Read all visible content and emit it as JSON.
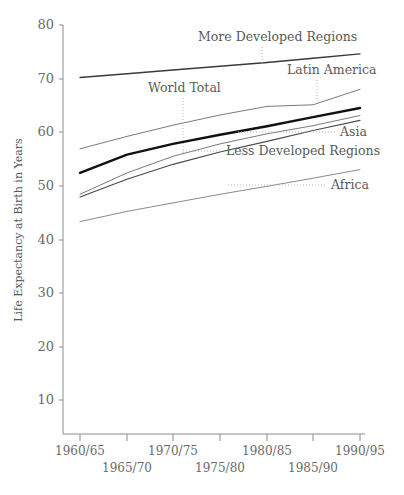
{
  "chart_data": {
    "type": "line",
    "title": "",
    "xlabel": "",
    "ylabel": "Life Expectancy at Birth in Years",
    "ylim": [
      0,
      80
    ],
    "xlim": [
      0,
      7
    ],
    "grid": false,
    "legend_position": "inline-labels-with-leader-lines",
    "categories": [
      "1960/65",
      "1965/70",
      "1970/75",
      "1975/80",
      "1980/85",
      "1985/90",
      "1990/95"
    ],
    "ytick_labels": [
      "10",
      "20",
      "30",
      "40",
      "50",
      "60",
      "70",
      "80"
    ],
    "ytick_values": [
      10,
      20,
      30,
      40,
      50,
      60,
      70,
      80
    ],
    "series": [
      {
        "name": "More Developed Regions",
        "style": "solid-medium",
        "color": "#3a3a3a",
        "width": 1.4,
        "values": [
          70.2,
          70.9,
          71.6,
          72.3,
          73.0,
          73.8,
          74.6
        ]
      },
      {
        "name": "Latin America",
        "style": "solid-thin",
        "color": "#7a7a7a",
        "width": 1.0,
        "values": [
          56.9,
          59.2,
          61.3,
          63.2,
          64.8,
          65.1,
          68.0
        ]
      },
      {
        "name": "World Total",
        "style": "solid-bold",
        "color": "#111111",
        "width": 2.4,
        "values": [
          52.4,
          55.8,
          57.8,
          59.5,
          61.1,
          62.8,
          64.5
        ]
      },
      {
        "name": "Asia",
        "style": "solid-thin",
        "color": "#7a7a7a",
        "width": 1.0,
        "values": [
          48.4,
          52.4,
          55.5,
          57.8,
          59.7,
          61.2,
          63.1
        ]
      },
      {
        "name": "Less Developed Regions",
        "style": "solid-medium",
        "color": "#4a4a4a",
        "width": 1.2,
        "values": [
          47.9,
          51.2,
          54.0,
          56.3,
          58.3,
          60.3,
          62.2
        ]
      },
      {
        "name": "Africa",
        "style": "solid-thin",
        "color": "#8a8a8a",
        "width": 1.0,
        "values": [
          43.3,
          45.2,
          46.8,
          48.4,
          49.9,
          51.4,
          53.0
        ]
      }
    ],
    "annotations": [
      {
        "text": "More Developed Regions",
        "anchor": "start",
        "x_px": 198,
        "y_px": 41,
        "leader": {
          "x1": 262,
          "y1": 47,
          "x2": 262,
          "y2": 65
        }
      },
      {
        "text": "Latin America",
        "anchor": "start",
        "x_px": 287,
        "y_px": 74,
        "leader": {
          "x1": 317,
          "y1": 80,
          "x2": 317,
          "y2": 101
        }
      },
      {
        "text": "World Total",
        "anchor": "start",
        "x_px": 148,
        "y_px": 92,
        "leader": {
          "x1": 183,
          "y1": 98,
          "x2": 183,
          "y2": 155
        }
      },
      {
        "text": "Asia",
        "anchor": "start",
        "x_px": 340,
        "y_px": 136,
        "leader": {
          "x1": 238,
          "y1": 132,
          "x2": 336,
          "y2": 132
        }
      },
      {
        "text": "Less Developed Regions",
        "anchor": "start",
        "x_px": 226,
        "y_px": 155,
        "leader": {
          "x1": 183,
          "y1": 151,
          "x2": 222,
          "y2": 151
        }
      },
      {
        "text": "Africa",
        "anchor": "start",
        "x_px": 331,
        "y_px": 189,
        "leader": {
          "x1": 228,
          "y1": 185,
          "x2": 327,
          "y2": 185
        }
      }
    ]
  },
  "axes": {
    "y_title": "Life Expectancy at Birth in Years",
    "y_ticks": [
      {
        "label": "80",
        "y_px": 25
      },
      {
        "label": "70",
        "y_px": 79
      },
      {
        "label": "60",
        "y_px": 132
      },
      {
        "label": "50",
        "y_px": 186
      },
      {
        "label": "40",
        "y_px": 240
      },
      {
        "label": "30",
        "y_px": 293
      },
      {
        "label": "20",
        "y_px": 347
      },
      {
        "label": "10",
        "y_px": 400
      }
    ],
    "x_ticks": [
      {
        "label": "1960/65",
        "x_px": 80,
        "row": 0
      },
      {
        "label": "1965/70",
        "x_px": 127,
        "row": 1
      },
      {
        "label": "1970/75",
        "x_px": 173,
        "row": 0
      },
      {
        "label": "1975/80",
        "x_px": 220,
        "row": 1
      },
      {
        "label": "1980/85",
        "x_px": 267,
        "row": 0
      },
      {
        "label": "1985/90",
        "x_px": 313,
        "row": 1
      },
      {
        "label": "1990/95",
        "x_px": 360,
        "row": 0
      }
    ]
  },
  "colors": {
    "axis": "#8c8c8c",
    "text": "#5f5f5f",
    "bold_series": "#111111",
    "thin_series": "#7a7a7a",
    "leader": "#b5b5b5",
    "background": "#ffffff"
  }
}
